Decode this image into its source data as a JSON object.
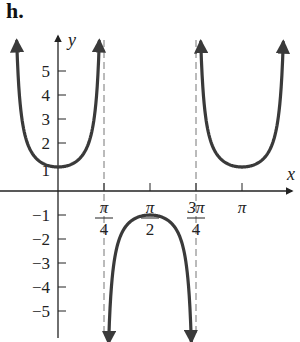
{
  "part_label": "h.",
  "axes": {
    "x_label": "x",
    "y_label": "y",
    "x_ticks": [
      {
        "num": "π",
        "den": "4",
        "value": 0.7854
      },
      {
        "num": "π",
        "den": "2",
        "value": 1.5708
      },
      {
        "num": "3π",
        "den": "4",
        "value": 2.3562
      },
      {
        "num": "π",
        "den": "",
        "value": 3.1416
      }
    ],
    "y_ticks_pos": [
      "1",
      "2",
      "3",
      "4",
      "5"
    ],
    "y_ticks_neg": [
      "−1",
      "−2",
      "−3",
      "−4",
      "−5"
    ]
  },
  "colors": {
    "curve": "#3a3a3a",
    "axis": "#222222",
    "asymptote": "#777777"
  },
  "chart_data": {
    "type": "line",
    "title": "",
    "function": "y = sec(2x)",
    "xlabel": "x",
    "ylabel": "y",
    "xlim": [
      -1.1,
      3.7
    ],
    "ylim": [
      -6,
      6.3
    ],
    "grid": false,
    "legend": null,
    "x_tick_labels": [
      "π/4",
      "π/2",
      "3π/4",
      "π"
    ],
    "y_tick_labels": [
      "-5",
      "-4",
      "-3",
      "-2",
      "-1",
      "1",
      "2",
      "3",
      "4",
      "5"
    ],
    "asymptotes": [
      {
        "x": 0.7854,
        "label": "π/4"
      },
      {
        "x": 2.3562,
        "label": "3π/4"
      }
    ],
    "series": [
      {
        "name": "branch-1",
        "x": [
          -0.72,
          -0.6,
          -0.4,
          -0.2,
          0,
          0.2,
          0.4,
          0.6,
          0.72
        ],
        "y": [
          6.0,
          2.76,
          1.43,
          1.09,
          1.0,
          1.09,
          1.43,
          2.76,
          6.0
        ]
      },
      {
        "name": "branch-2",
        "x": [
          0.85,
          1.0,
          1.2,
          1.4,
          1.5708,
          1.74,
          1.94,
          2.14,
          2.29
        ],
        "y": [
          -6.0,
          -2.4,
          -1.35,
          -1.06,
          -1.0,
          -1.06,
          -1.35,
          -2.4,
          -6.0
        ]
      },
      {
        "name": "branch-3",
        "x": [
          2.42,
          2.6,
          2.8,
          3.0,
          3.1416,
          3.3,
          3.5,
          3.7,
          3.86
        ],
        "y": [
          6.0,
          2.28,
          1.3,
          1.04,
          1.0,
          1.05,
          1.33,
          2.4,
          6.0
        ]
      }
    ]
  }
}
